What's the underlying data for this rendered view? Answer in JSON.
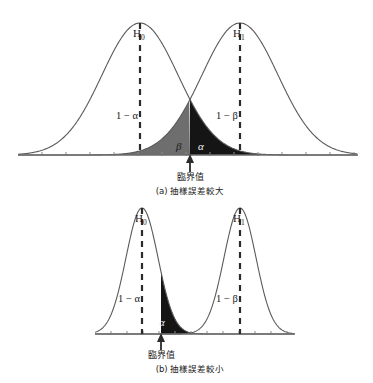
{
  "figure": {
    "title_visible": false,
    "background": "#ffffff",
    "colors": {
      "curve": "#5a5a5a",
      "axis": "#6b6b6b",
      "dashed_line": "#2b2b2b",
      "beta_fill": "#6e6e6e",
      "alpha_fill": "#151515",
      "text": "#1a1a1a"
    }
  },
  "panels": [
    {
      "id": "panel-a",
      "caption": "(a) 抽樣誤差較大",
      "critical_value_label": "臨界值",
      "labels": {
        "null_hypothesis": "H",
        "null_subscript": "0",
        "alt_hypothesis": "H",
        "alt_subscript": "1",
        "power_left": "1 − α",
        "power_right": "1 − β",
        "beta_region": "β",
        "alpha_region": "α"
      },
      "geometry": {
        "axis_y": 155,
        "axis_x_start": 18,
        "axis_x_end": 358,
        "h0_mean": 140,
        "h1_mean": 240,
        "sigma": 38,
        "peak_height": 132,
        "critical_value_x": 190
      }
    },
    {
      "id": "panel-b",
      "caption": "(b) 抽樣誤差較小",
      "critical_value_label": "臨界值",
      "labels": {
        "null_hypothesis": "H",
        "null_subscript": "0",
        "alt_hypothesis": "H",
        "alt_subscript": "1",
        "power_left": "1 − α",
        "power_right": "1 − β",
        "alpha_region": "α"
      },
      "geometry": {
        "axis_y": 334,
        "axis_x_start": 95,
        "axis_x_end": 295,
        "h0_mean": 142,
        "h1_mean": 240,
        "sigma": 16,
        "peak_height": 126,
        "critical_value_x": 161
      }
    }
  ],
  "chart_data": {
    "type": "line",
    "xlabel": "",
    "ylabel": "",
    "grid": false,
    "legend_position": "none",
    "annotations": [
      "H0",
      "H1",
      "1 − α",
      "1 − β",
      "α",
      "β",
      "臨界值",
      "(a) 抽樣誤差較大",
      "(b) 抽樣誤差較小"
    ],
    "series": [
      {
        "name": "H0 (panel a)",
        "distribution": "normal",
        "mean": 140,
        "sigma": 38,
        "shaded_region": "alpha",
        "shade_from": 190,
        "shade_to": 358
      },
      {
        "name": "H1 (panel a)",
        "distribution": "normal",
        "mean": 240,
        "sigma": 38,
        "shaded_region": "beta",
        "shade_from": 18,
        "shade_to": 190
      },
      {
        "name": "H0 (panel b)",
        "distribution": "normal",
        "mean": 142,
        "sigma": 16,
        "shaded_region": "alpha",
        "shade_from": 161,
        "shade_to": 295
      },
      {
        "name": "H1 (panel b)",
        "distribution": "normal",
        "mean": 240,
        "sigma": 16,
        "shaded_region": "none",
        "shade_from": null,
        "shade_to": null
      }
    ]
  }
}
